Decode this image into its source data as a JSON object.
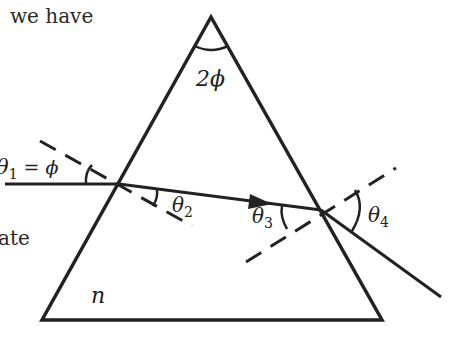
{
  "page_text": {
    "top_fragment": "we have",
    "mid_fragment": "ate"
  },
  "diagram": {
    "labels": {
      "apex_angle": "2ϕ",
      "theta1": "θ",
      "theta1_sub": "1",
      "theta1_eq": " = ϕ",
      "theta2": "θ",
      "theta2_sub": "2",
      "theta3": "θ",
      "theta3_sub": "3",
      "theta4": "θ",
      "theta4_sub": "4",
      "refractive_index": "n"
    },
    "colors": {
      "stroke": "#222222",
      "background": "#ffffff"
    }
  }
}
